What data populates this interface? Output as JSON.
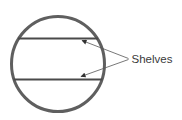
{
  "diagram": {
    "label": "Shelves",
    "background": "#ffffff",
    "circle": {
      "cx": 58,
      "cy": 64,
      "rx": 46.5,
      "ry": 47.5,
      "stroke": "#5f5f5f",
      "stroke_width": 3
    },
    "shelves": [
      {
        "x1": 18,
        "y1": 38.5,
        "x2": 98,
        "y2": 38.5
      },
      {
        "x1": 13.5,
        "y1": 79.5,
        "x2": 102.5,
        "y2": 79.5
      }
    ],
    "shelf_style": {
      "stroke": "#4a4a4a",
      "stroke_width": 1.8
    },
    "arrows": [
      {
        "x1": 128.5,
        "y1": 58.5,
        "x2": 82,
        "y2": 40.5
      },
      {
        "x1": 128.5,
        "y1": 59.5,
        "x2": 81,
        "y2": 76.5
      }
    ],
    "arrow_style": {
      "stroke": "#555555",
      "stroke_width": 0.8,
      "head_fill": "#333333"
    },
    "label_pos": {
      "x": 131.5,
      "y": 62.5
    },
    "label_style": {
      "fill": "#3a3a3a",
      "font_size": 11.5
    }
  }
}
